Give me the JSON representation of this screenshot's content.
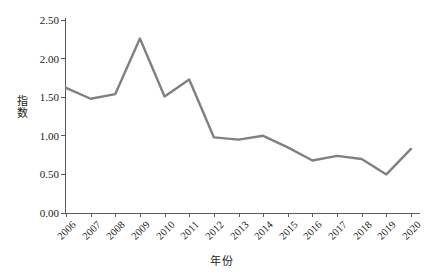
{
  "chart_data": {
    "type": "line",
    "title": "",
    "xlabel": "年份",
    "ylabel": "指数",
    "categories": [
      "2006",
      "2007",
      "2008",
      "2009",
      "2010",
      "2011",
      "2012",
      "2013",
      "2014",
      "2015",
      "2016",
      "2017",
      "2018",
      "2019",
      "2020"
    ],
    "x": [
      2006,
      2007,
      2008,
      2009,
      2010,
      2011,
      2012,
      2013,
      2014,
      2015,
      2016,
      2017,
      2018,
      2019,
      2020
    ],
    "values": [
      1.62,
      1.48,
      1.54,
      2.26,
      1.51,
      1.73,
      0.98,
      0.95,
      1.0,
      0.85,
      0.68,
      0.74,
      0.7,
      0.5,
      0.83
    ],
    "series": [
      {
        "name": "指数",
        "values": [
          1.62,
          1.48,
          1.54,
          2.26,
          1.51,
          1.73,
          0.98,
          0.95,
          1.0,
          0.85,
          0.68,
          0.74,
          0.7,
          0.5,
          0.83
        ],
        "color": "#808080"
      }
    ],
    "ylim": [
      0.0,
      2.5
    ],
    "yticks": [
      0.0,
      0.5,
      1.0,
      1.5,
      2.0,
      2.5
    ],
    "ytick_labels": [
      "0.00",
      "0.50",
      "1.00",
      "1.50",
      "2.00",
      "2.50"
    ],
    "xlim": [
      2006,
      2020
    ],
    "grid": false,
    "legend": false,
    "legend_position": "none",
    "line_color": "#808080",
    "axis_color": "#5a5a5a",
    "background_color": "#ffffff",
    "markers": false,
    "line_width": 2.4,
    "xtick_label_rotation": -45
  }
}
